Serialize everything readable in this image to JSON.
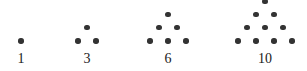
{
  "figure": {
    "background_color": "#ffffff",
    "dot_color": "#333333",
    "label_color": "#1a1a1a",
    "dot_diameter_px": 5.4,
    "dot_spacing_x_px": 18,
    "dot_spacing_y_px": 13.2,
    "baseline_row_y_px": 41,
    "label_y_px": 52
  },
  "chart_data": {
    "type": "scatter",
    "xlabel": "",
    "ylabel": "",
    "grid": false,
    "legend": "none",
    "categories": [
      "1",
      "3",
      "6",
      "10"
    ],
    "values": [
      1,
      3,
      6,
      10
    ],
    "series": [
      {
        "name": "1",
        "label": "1",
        "rows": 1,
        "total_dots": 1,
        "row_counts": [
          1
        ],
        "center_x": 21,
        "label_x": 21,
        "points": [
          {
            "x": 21,
            "y": 41
          }
        ]
      },
      {
        "name": "3",
        "label": "3",
        "rows": 2,
        "total_dots": 3,
        "row_counts": [
          1,
          2
        ],
        "center_x": 87,
        "label_x": 87,
        "points": [
          {
            "x": 87,
            "y": 27.8
          },
          {
            "x": 78,
            "y": 41
          },
          {
            "x": 96,
            "y": 41
          }
        ]
      },
      {
        "name": "6",
        "label": "6",
        "rows": 3,
        "total_dots": 6,
        "row_counts": [
          1,
          2,
          3
        ],
        "center_x": 168,
        "label_x": 168,
        "points": [
          {
            "x": 168,
            "y": 14.6
          },
          {
            "x": 159,
            "y": 27.8
          },
          {
            "x": 177,
            "y": 27.8
          },
          {
            "x": 150,
            "y": 41
          },
          {
            "x": 168,
            "y": 41
          },
          {
            "x": 186,
            "y": 41
          }
        ]
      },
      {
        "name": "10",
        "label": "10",
        "rows": 4,
        "total_dots": 10,
        "row_counts": [
          1,
          2,
          3,
          4
        ],
        "center_x": 265,
        "label_x": 265,
        "points": [
          {
            "x": 265,
            "y": 1.4
          },
          {
            "x": 256,
            "y": 14.6
          },
          {
            "x": 274,
            "y": 14.6
          },
          {
            "x": 247,
            "y": 27.8
          },
          {
            "x": 265,
            "y": 27.8
          },
          {
            "x": 283,
            "y": 27.8
          },
          {
            "x": 238,
            "y": 41
          },
          {
            "x": 256,
            "y": 41
          },
          {
            "x": 274,
            "y": 41
          },
          {
            "x": 292,
            "y": 41
          }
        ]
      }
    ]
  }
}
